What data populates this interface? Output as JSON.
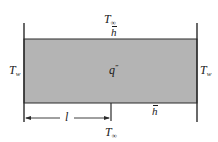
{
  "diagram": {
    "colors": {
      "fill": "#b4b4b4",
      "stroke": "#2a2a2a",
      "background": "#ffffff"
    },
    "plate": {
      "x": 24,
      "y": 39,
      "width": 173,
      "height": 64,
      "generation_label": {
        "symbol": "q",
        "superscript": "‴"
      }
    },
    "walls": {
      "left": {
        "x": 24,
        "y1": 23,
        "y2": 122,
        "label": {
          "symbol": "T",
          "subscript": "w"
        }
      },
      "right": {
        "x": 197,
        "y1": 23,
        "y2": 122,
        "label": {
          "symbol": "T",
          "subscript": "w"
        }
      }
    },
    "top_surface": {
      "ambient_label": {
        "symbol": "T",
        "subscript": "∞"
      },
      "coefficient_label": {
        "symbol": "h"
      }
    },
    "bottom_surface": {
      "ambient_label": {
        "symbol": "T",
        "subscript": "∞"
      },
      "coefficient_label": {
        "symbol": "h"
      }
    },
    "dimension": {
      "label": "l",
      "from_x": 24,
      "to_x": 111,
      "y": 118,
      "tick_x": 111
    }
  }
}
